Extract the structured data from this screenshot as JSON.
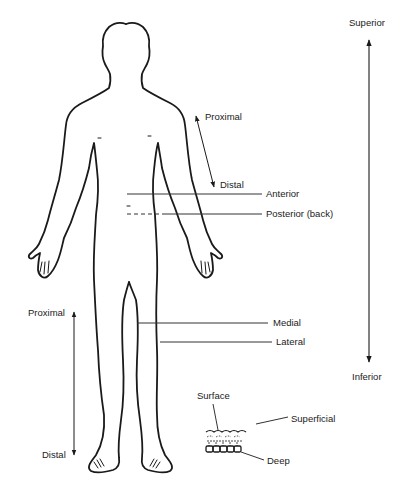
{
  "diagram": {
    "title": "",
    "colors": {
      "ink": "#1a1a1a",
      "guide": "#333333",
      "label": "#222222",
      "background": "#ffffff"
    },
    "labels": {
      "superior": "Superior",
      "inferior": "Inferior",
      "arm_proximal": "Proximal",
      "arm_distal": "Distal",
      "anterior": "Anterior",
      "posterior": "Posterior (back)",
      "medial": "Medial",
      "lateral": "Lateral",
      "leg_proximal": "Proximal",
      "leg_distal": "Distal",
      "surface": "Surface",
      "superficial": "Superficial",
      "deep": "Deep"
    },
    "figure": "human-body-front-outline",
    "arrows": [
      {
        "name": "superior-inferior",
        "type": "double-headed",
        "orientation": "vertical"
      },
      {
        "name": "arm-proximal-distal",
        "type": "double-headed",
        "orientation": "diagonal"
      },
      {
        "name": "leg-proximal-distal",
        "type": "double-headed",
        "orientation": "vertical"
      }
    ],
    "reference_lines": [
      {
        "name": "anterior",
        "style": "solid"
      },
      {
        "name": "posterior",
        "style": "dashed-to-solid"
      },
      {
        "name": "medial",
        "style": "solid"
      },
      {
        "name": "lateral",
        "style": "solid"
      }
    ],
    "inset": "skin-layers-cross-section"
  }
}
